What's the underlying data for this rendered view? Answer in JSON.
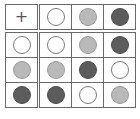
{
  "colors": {
    "white": "#ffffff",
    "light": "#b9b9b9",
    "dark": "#5c5c5c"
  },
  "header": {
    "cornerSymbol": "+",
    "cells": [
      "white",
      "light",
      "dark"
    ]
  },
  "grid": [
    [
      "white",
      "white",
      "light",
      "dark"
    ],
    [
      "light",
      "light",
      "dark",
      "white"
    ],
    [
      "dark",
      "dark",
      "white",
      "light"
    ]
  ]
}
